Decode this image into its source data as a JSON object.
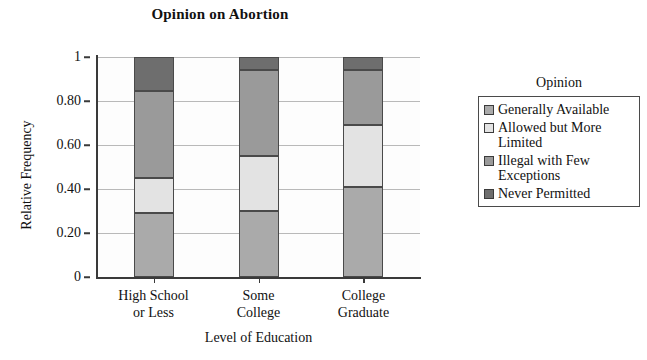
{
  "chart_data": {
    "type": "bar",
    "subtype": "stacked-bar-relative-frequency",
    "title": "Opinion on Abortion",
    "xlabel": "Level of Education",
    "ylabel": "Relative Frequency",
    "categories": [
      "High School or Less",
      "Some College",
      "College Graduate"
    ],
    "category_lines": [
      [
        "High School",
        "or Less"
      ],
      [
        "Some",
        "College"
      ],
      [
        "College",
        "Graduate"
      ]
    ],
    "legend_title": "Opinion",
    "legend_position": "right",
    "grid": true,
    "ylim": [
      0,
      1
    ],
    "ytick_labels": [
      "0",
      "0.20",
      "0.40",
      "0.60",
      "0.80",
      "1"
    ],
    "ytick_values": [
      0,
      0.2,
      0.4,
      0.6,
      0.8,
      1
    ],
    "series": [
      {
        "name": "Generally Available",
        "color": "#aaaaaa",
        "values": [
          0.29,
          0.3,
          0.41
        ],
        "cumulative_top": [
          0.29,
          0.3,
          0.41
        ]
      },
      {
        "name": "Allowed but More Limited",
        "color": "#e3e3e3",
        "values": [
          0.16,
          0.25,
          0.28
        ],
        "cumulative_top": [
          0.45,
          0.55,
          0.69
        ]
      },
      {
        "name": "Illegal with Few Exceptions",
        "color": "#9a9a9a",
        "values": [
          0.395,
          0.39,
          0.25
        ],
        "cumulative_top": [
          0.845,
          0.94,
          0.94
        ]
      },
      {
        "name": "Never Permitted",
        "color": "#6e6e6e",
        "values": [
          0.155,
          0.06,
          0.06
        ],
        "cumulative_top": [
          1.0,
          1.0,
          1.0
        ]
      }
    ]
  },
  "legend": {
    "title": "Opinion",
    "items": [
      {
        "label": "Generally Available",
        "color": "#aaaaaa"
      },
      {
        "label": "Allowed but More Limited",
        "color": "#e3e3e3"
      },
      {
        "label": "Illegal with Few Exceptions",
        "color": "#9a9a9a"
      },
      {
        "label": "Never Permitted",
        "color": "#6e6e6e"
      }
    ]
  }
}
